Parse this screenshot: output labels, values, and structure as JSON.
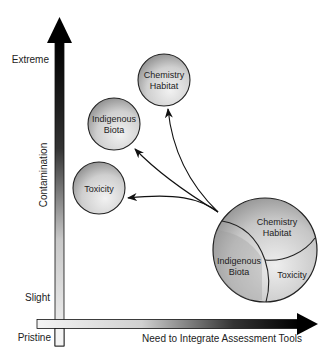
{
  "y_axis": {
    "title": "Contamination",
    "top_label": "Extreme",
    "mid_label": "Slight",
    "bottom_label": "Pristine"
  },
  "x_axis": {
    "title": "Need to Integrate Assessment Tools"
  },
  "small_circles": [
    {
      "name": "chemistry-habitat",
      "line1": "Chemistry",
      "line2": "Habitat"
    },
    {
      "name": "indigenous-biota",
      "line1": "Indigenous",
      "line2": "Biota"
    },
    {
      "name": "toxicity",
      "line1": "Toxicity"
    }
  ],
  "integrated_circle": {
    "chemistry_line1": "Chemistry",
    "chemistry_line2": "Habitat",
    "biota_line1": "Indigenous",
    "biota_line2": "Biota",
    "toxicity": "Toxicity"
  }
}
